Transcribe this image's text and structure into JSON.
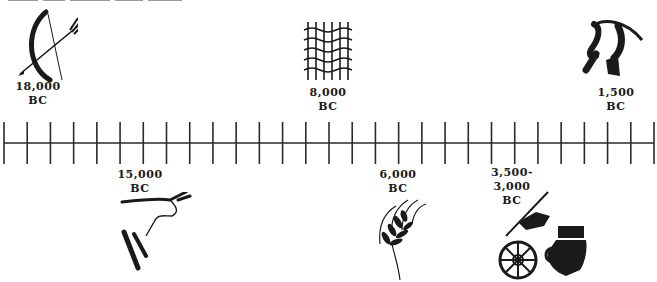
{
  "diagram": {
    "type": "timeline",
    "orientation": "horizontal",
    "axis": {
      "tick_count": 29,
      "line_color": "#2a2a2a"
    },
    "events_above": [
      {
        "id": "bow",
        "year": "18,000",
        "era": "BC",
        "icon": "bow-and-arrow-icon",
        "position_x": 40
      },
      {
        "id": "weaving",
        "year": "8,000",
        "era": "BC",
        "icon": "woven-net-icon",
        "position_x": 328
      },
      {
        "id": "plow",
        "year": "1,500",
        "era": "BC",
        "icon": "plow-icon",
        "position_x": 615
      }
    ],
    "events_below": [
      {
        "id": "cave-painting",
        "year": "15,000",
        "era": "BC",
        "icon": "cave-painting-bull-icon",
        "position_x": 140
      },
      {
        "id": "agriculture",
        "year": "6,000",
        "era": "BC",
        "icon": "wheat-stalk-icon",
        "position_x": 398
      },
      {
        "id": "writing-wheel-pottery",
        "year": "3,500-",
        "year_line2": "3,000",
        "era": "BC",
        "icon": "writing-wheel-pottery-icon",
        "position_x": 512
      }
    ]
  },
  "colors": {
    "ink": "#1a1a1a",
    "background": "#ffffff"
  }
}
